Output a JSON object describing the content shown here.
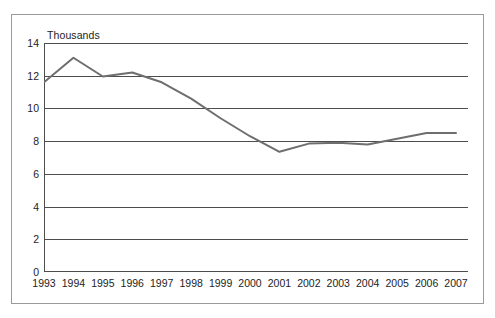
{
  "chart_data": {
    "type": "line",
    "title": "",
    "subtitle": "",
    "unit_label": "Thousands",
    "xlabel": "",
    "ylabel": "",
    "ylim": [
      0,
      14
    ],
    "ytick_step": 2,
    "yticks": [
      14,
      12,
      10,
      8,
      6,
      4,
      2,
      0
    ],
    "grid": "horizontal",
    "legend": "none",
    "categories": [
      "1993",
      "1994",
      "1995",
      "1996",
      "1997",
      "1998",
      "1999",
      "2000",
      "2001",
      "2002",
      "2003",
      "2004",
      "2005",
      "2006",
      "2007"
    ],
    "series": [
      {
        "name": "series-1",
        "color": "#6e6e6e",
        "values": [
          11.6,
          13.1,
          11.95,
          12.2,
          11.6,
          10.6,
          9.4,
          8.3,
          7.35,
          7.85,
          7.9,
          7.8,
          8.15,
          8.5,
          8.5
        ]
      }
    ],
    "annotations": []
  },
  "axis": {
    "unit_label": "Thousands"
  },
  "colors": {
    "line": "#6e6e6e",
    "grid": "#4d4d4d",
    "axis": "#4d4d4d",
    "frame": "#9a9a9a",
    "text": "#1d1d1d",
    "background": "#ffffff"
  }
}
